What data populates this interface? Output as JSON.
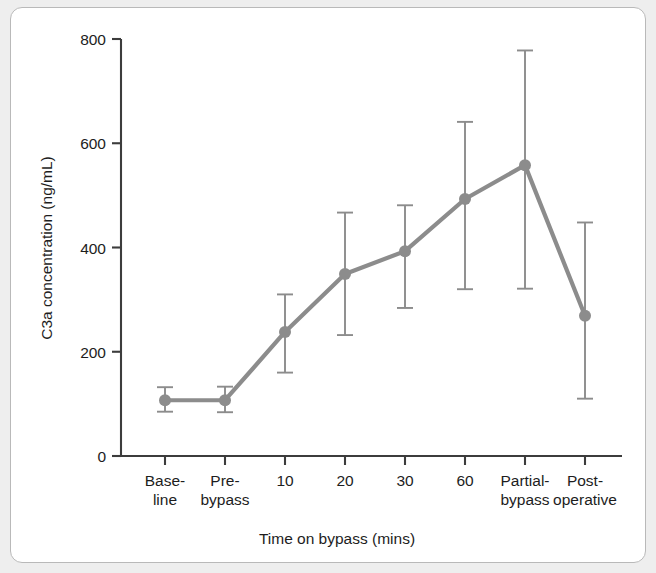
{
  "chart_data": {
    "type": "line",
    "title": "",
    "subtitle": "",
    "xlabel": "Time on bypass (mins)",
    "ylabel": "C3a concentration (ng/mL)",
    "categories": [
      "Base-line",
      "Pre-bypass",
      "10",
      "20",
      "30",
      "60",
      "Partial-bypass",
      "Post-operative"
    ],
    "category_lines": [
      [
        "Base-",
        "line"
      ],
      [
        "Pre-",
        "bypass"
      ],
      [
        "10",
        ""
      ],
      [
        "20",
        ""
      ],
      [
        "30",
        ""
      ],
      [
        "60",
        ""
      ],
      [
        "Partial-",
        "bypass"
      ],
      [
        "Post-",
        "operative"
      ]
    ],
    "values": [
      107,
      107,
      238,
      349,
      393,
      493,
      558,
      269
    ],
    "error_upper": [
      132,
      133,
      310,
      467,
      481,
      641,
      778,
      448
    ],
    "error_lower": [
      85,
      84,
      160,
      232,
      284,
      320,
      321,
      110
    ],
    "ylim": [
      0,
      800
    ],
    "yticks": [
      0,
      200,
      400,
      600,
      800
    ],
    "ytick_labels": [
      "0",
      "200",
      "400",
      "600",
      "800"
    ],
    "grid": false,
    "legend": null,
    "series": [
      {
        "name": "C3a concentration",
        "values": [
          107,
          107,
          238,
          349,
          393,
          493,
          558,
          269
        ],
        "color": "#8c8c8c"
      }
    ],
    "colors": {
      "series": "#8c8c8c",
      "axis": "#3c3c3c",
      "text": "#1d1d1d",
      "figure_background": "#ffffff",
      "page_background": "#eeeeee",
      "frame_border": "#b9b9b9"
    }
  }
}
